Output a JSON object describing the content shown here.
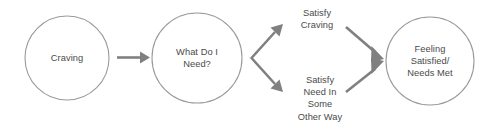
{
  "diagram": {
    "background_color": "#ffffff",
    "node_stroke_color": "#9a9a9a",
    "arrow_color": "#808080",
    "text_color": "#4a4a4a",
    "nodes": [
      {
        "id": "craving",
        "label": "Craving",
        "shape": "circle",
        "cx": 67,
        "cy": 58,
        "r": 42
      },
      {
        "id": "what-do-i-need",
        "label": "What Do I\nNeed?",
        "shape": "circle",
        "cx": 197,
        "cy": 58,
        "r": 45
      },
      {
        "id": "feeling-satisfied",
        "label": "Feeling\nSatisfied/\nNeeds Met",
        "shape": "circle",
        "cx": 430,
        "cy": 61,
        "r": 44
      }
    ],
    "branch_labels": [
      {
        "id": "satisfy-craving",
        "label": "Satisfy\nCraving",
        "cx": 317,
        "cy": 19
      },
      {
        "id": "satisfy-need-other-way",
        "label": "Satisfy\nNeed In\nSome\nOther Way",
        "cx": 320,
        "cy": 98
      }
    ],
    "connections": [
      {
        "id": "craving-to-need",
        "from": "craving",
        "to": "what-do-i-need",
        "style": "straight-arrow"
      },
      {
        "id": "need-to-satisfy-craving",
        "from": "what-do-i-need",
        "to": "satisfy-craving",
        "style": "elbow-arrow-up"
      },
      {
        "id": "need-to-satisfy-other",
        "from": "what-do-i-need",
        "to": "satisfy-need-other-way",
        "style": "elbow-arrow-down"
      },
      {
        "id": "satisfy-craving-to-feeling",
        "from": "satisfy-craving",
        "to": "feeling-satisfied",
        "style": "diagonal-arrow-down"
      },
      {
        "id": "satisfy-other-to-feeling",
        "from": "satisfy-need-other-way",
        "to": "feeling-satisfied",
        "style": "diagonal-arrow-up"
      }
    ]
  }
}
